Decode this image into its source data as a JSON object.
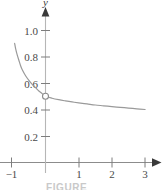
{
  "figure": {
    "caption": "FIGURE",
    "background_color": "#ffffff"
  },
  "chart_data": {
    "type": "line",
    "title": "",
    "subtitle": "",
    "xlabel": "",
    "ylabel": "y",
    "xlim": [
      -1.25,
      3.3
    ],
    "ylim": [
      0,
      1.12
    ],
    "grid": false,
    "legend": null,
    "axis_style": {
      "x_axis_color": "#8c8c8c",
      "y_axis_color": "#b3b3b3",
      "x_arrow": true,
      "y_arrow": true,
      "tick_color": "#7d7d7d"
    },
    "xticks": [
      -1,
      1,
      2,
      3
    ],
    "xticklabels": [
      "−1",
      "1",
      "2",
      "3"
    ],
    "yticks": [
      0.2,
      0.4,
      0.6,
      0.8,
      1.0
    ],
    "yticklabels": [
      "0.2",
      "0.4",
      "0.6",
      "0.8",
      "1.0"
    ],
    "series": [
      {
        "name": "curve",
        "color": "#9a9a9a",
        "linewidth": 1.2,
        "x": [
          -0.93,
          -0.9,
          -0.85,
          -0.8,
          -0.75,
          -0.7,
          -0.6,
          -0.5,
          -0.4,
          -0.3,
          -0.2,
          -0.1,
          0.0,
          0.2,
          0.4,
          0.6,
          0.8,
          1.0,
          1.25,
          1.5,
          1.75,
          2.0,
          2.25,
          2.5,
          2.75,
          3.0
        ],
        "y": [
          0.9,
          0.86,
          0.81,
          0.77,
          0.73,
          0.7,
          0.655,
          0.62,
          0.59,
          0.565,
          0.54,
          0.52,
          0.5,
          0.485,
          0.474,
          0.465,
          0.457,
          0.45,
          0.442,
          0.434,
          0.428,
          0.422,
          0.416,
          0.411,
          0.405,
          0.4
        ]
      }
    ],
    "markers": [
      {
        "name": "open-circle-discontinuity",
        "x": 0,
        "y": 0.5,
        "style": "open",
        "radius": 3,
        "edge_color": "#8c8c8c",
        "fill_color": "#ffffff"
      }
    ],
    "annotations": []
  }
}
